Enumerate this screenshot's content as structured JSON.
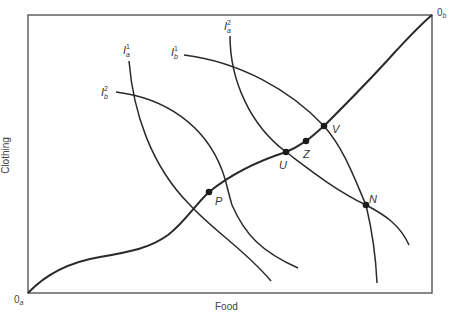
{
  "diagram": {
    "type": "edgeworth-box",
    "x_axis_label": "Food",
    "y_axis_label": "Clothing",
    "origins": {
      "a": {
        "base": "0",
        "sub": "a"
      },
      "b": {
        "base": "0",
        "sub": "b"
      }
    },
    "indifference_curves": [
      {
        "id": "Ia1",
        "base": "I",
        "sup": "1",
        "sub": "a"
      },
      {
        "id": "Ia2",
        "base": "I",
        "sup": "2",
        "sub": "a"
      },
      {
        "id": "Ib1",
        "base": "I",
        "sup": "1",
        "sub": "b"
      },
      {
        "id": "Ib2",
        "base": "I",
        "sup": "2",
        "sub": "b"
      }
    ],
    "points": [
      {
        "label": "P"
      },
      {
        "label": "U"
      },
      {
        "label": "Z"
      },
      {
        "label": "V"
      },
      {
        "label": "N"
      }
    ],
    "colors": {
      "line": "#2a2a2a",
      "frame": "#555555",
      "text": "#333333"
    }
  }
}
